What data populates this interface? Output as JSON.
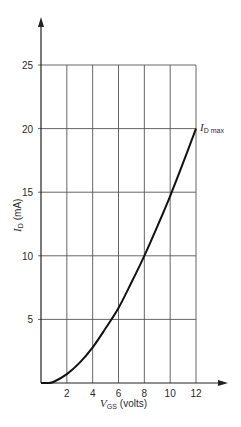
{
  "chart_data": {
    "type": "line",
    "title": "",
    "xlabel": "V_GS (volts)",
    "xlabel_parts": {
      "symbol": "V",
      "subscript": "GS",
      "unit": "(volts)"
    },
    "ylabel": "I_D (mA)",
    "ylabel_parts": {
      "symbol": "I",
      "subscript": "D",
      "unit": "(mA)"
    },
    "xlim": [
      0,
      12
    ],
    "ylim": [
      0,
      25
    ],
    "x_ticks": [
      2,
      4,
      6,
      8,
      10,
      12
    ],
    "y_ticks": [
      5,
      10,
      15,
      20,
      25
    ],
    "grid": true,
    "legend": null,
    "series": [
      {
        "name": "I_D vs V_GS",
        "x": [
          0,
          0.5,
          1,
          2,
          3,
          4,
          5,
          6,
          7,
          8,
          9,
          10,
          11,
          12
        ],
        "y": [
          0,
          0,
          0.1,
          0.7,
          1.6,
          2.8,
          4.3,
          5.9,
          7.9,
          10.0,
          12.3,
          14.7,
          17.3,
          20.0
        ]
      }
    ],
    "annotations": [
      {
        "text": "I_D max",
        "symbol": "I",
        "subscript": "D max",
        "x": 12,
        "y": 20
      }
    ],
    "colors": {
      "line": "#111111",
      "grid": "#555555",
      "text": "#2a2a2a"
    }
  }
}
